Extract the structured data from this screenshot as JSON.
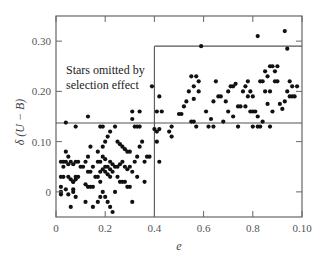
{
  "chart_data": {
    "type": "scatter",
    "title": "",
    "xlabel": "e",
    "ylabel": "δ (U − B)",
    "x_ticks": [
      {
        "value": 0.0,
        "label": "0"
      },
      {
        "value": 0.2,
        "label": "0.2"
      },
      {
        "value": 0.4,
        "label": "0.4"
      },
      {
        "value": 0.6,
        "label": "0.6"
      },
      {
        "value": 0.8,
        "label": "0.8"
      },
      {
        "value": 1.0,
        "label": "0.10"
      }
    ],
    "y_ticks": [
      {
        "value": 0.0,
        "label": "0"
      },
      {
        "value": 0.1,
        "label": "0.10"
      },
      {
        "value": 0.2,
        "label": "0.20"
      },
      {
        "value": 0.3,
        "label": "0.30"
      }
    ],
    "xlim": [
      0,
      1.0
    ],
    "ylim": [
      -0.05,
      0.35
    ],
    "grid": false,
    "annotations": [
      {
        "text_lines": [
          "Stars omitted by",
          "selection effect"
        ],
        "x": 0.06,
        "y": 0.25
      }
    ],
    "boundary_lines": [
      {
        "type": "horizontal",
        "y": 0.137,
        "x_from": 0.0,
        "x_to": 1.0
      },
      {
        "type": "vertical",
        "x": 0.4,
        "y_from": -0.05,
        "y_to": 0.29
      },
      {
        "type": "horizontal",
        "y": 0.29,
        "x_from": 0.4,
        "x_to": 1.0
      }
    ],
    "series": [
      {
        "name": "stars",
        "points": [
          [
            0.04,
            0.138
          ],
          [
            0.08,
            0.13
          ],
          [
            0.13,
            0.15
          ],
          [
            0.18,
            0.13
          ],
          [
            0.19,
            0.13
          ],
          [
            0.24,
            0.13
          ],
          [
            0.31,
            0.16
          ],
          [
            0.31,
            0.145
          ],
          [
            0.34,
            0.16
          ],
          [
            0.32,
            0.13
          ],
          [
            0.33,
            0.13
          ],
          [
            0.34,
            0.13
          ],
          [
            0.39,
            0.21
          ],
          [
            0.02,
            0.06
          ],
          [
            0.03,
            0.06
          ],
          [
            0.04,
            0.06
          ],
          [
            0.05,
            0.055
          ],
          [
            0.06,
            0.06
          ],
          [
            0.07,
            0.055
          ],
          [
            0.08,
            0.06
          ],
          [
            0.09,
            0.06
          ],
          [
            0.04,
            0.08
          ],
          [
            0.05,
            0.07
          ],
          [
            0.03,
            0.05
          ],
          [
            0.02,
            0.03
          ],
          [
            0.03,
            0.03
          ],
          [
            0.05,
            0.03
          ],
          [
            0.06,
            0.025
          ],
          [
            0.07,
            0.02
          ],
          [
            0.08,
            0.03
          ],
          [
            0.09,
            0.03
          ],
          [
            0.08,
            0.025
          ],
          [
            0.07,
            0.02
          ],
          [
            0.1,
            0.05
          ],
          [
            0.11,
            0.05
          ],
          [
            0.02,
            0.01
          ],
          [
            0.02,
            0.0
          ],
          [
            0.02,
            -0.005
          ],
          [
            0.04,
            0.005
          ],
          [
            0.05,
            -0.005
          ],
          [
            0.07,
            0.0
          ],
          [
            0.08,
            -0.01
          ],
          [
            0.07,
            0.005
          ],
          [
            0.06,
            -0.03
          ],
          [
            0.12,
            0.06
          ],
          [
            0.13,
            0.04
          ],
          [
            0.14,
            0.04
          ],
          [
            0.12,
            0.015
          ],
          [
            0.13,
            0.01
          ],
          [
            0.14,
            0.01
          ],
          [
            0.15,
            0.01
          ],
          [
            0.13,
            0.07
          ],
          [
            0.14,
            0.09
          ],
          [
            0.15,
            0.05
          ],
          [
            0.12,
            -0.02
          ],
          [
            0.15,
            -0.03
          ],
          [
            0.17,
            -0.02
          ],
          [
            0.16,
            0.03
          ],
          [
            0.17,
            0.03
          ],
          [
            0.18,
            0.04
          ],
          [
            0.19,
            0.045
          ],
          [
            0.2,
            0.05
          ],
          [
            0.21,
            0.05
          ],
          [
            0.22,
            0.045
          ],
          [
            0.2,
            0.04
          ],
          [
            0.21,
            0.035
          ],
          [
            0.22,
            0.03
          ],
          [
            0.23,
            0.04
          ],
          [
            0.24,
            0.05
          ],
          [
            0.25,
            0.05
          ],
          [
            0.26,
            0.055
          ],
          [
            0.18,
            0.06
          ],
          [
            0.19,
            0.07
          ],
          [
            0.19,
            0.09
          ],
          [
            0.2,
            0.1
          ],
          [
            0.21,
            0.11
          ],
          [
            0.22,
            0.12
          ],
          [
            0.2,
            0.065
          ],
          [
            0.22,
            0.06
          ],
          [
            0.23,
            0.055
          ],
          [
            0.17,
            0.08
          ],
          [
            0.17,
            0.06
          ],
          [
            0.18,
            0.02
          ],
          [
            0.19,
            0.0
          ],
          [
            0.2,
            -0.01
          ],
          [
            0.18,
            -0.01
          ],
          [
            0.21,
            -0.02
          ],
          [
            0.22,
            -0.03
          ],
          [
            0.23,
            -0.04
          ],
          [
            0.25,
            0.1
          ],
          [
            0.26,
            0.095
          ],
          [
            0.27,
            0.09
          ],
          [
            0.28,
            0.085
          ],
          [
            0.29,
            0.08
          ],
          [
            0.3,
            0.08
          ],
          [
            0.27,
            0.06
          ],
          [
            0.28,
            0.05
          ],
          [
            0.29,
            0.045
          ],
          [
            0.3,
            0.05
          ],
          [
            0.31,
            0.04
          ],
          [
            0.32,
            0.06
          ],
          [
            0.33,
            0.07
          ],
          [
            0.34,
            0.09
          ],
          [
            0.25,
            0.03
          ],
          [
            0.26,
            0.02
          ],
          [
            0.27,
            0.02
          ],
          [
            0.28,
            0.02
          ],
          [
            0.29,
            0.01
          ],
          [
            0.3,
            0.01
          ],
          [
            0.31,
            -0.02
          ],
          [
            0.24,
            0.0
          ],
          [
            0.33,
            0.03
          ],
          [
            0.35,
            0.1
          ],
          [
            0.36,
            0.06
          ],
          [
            0.37,
            0.07
          ],
          [
            0.36,
            0.02
          ],
          [
            0.38,
            0.07
          ],
          [
            0.4,
            0.125
          ],
          [
            0.41,
            0.1
          ],
          [
            0.42,
            0.06
          ],
          [
            0.41,
            0.12
          ],
          [
            0.42,
            0.125
          ],
          [
            0.41,
            0.16
          ],
          [
            0.42,
            0.19
          ],
          [
            0.43,
            0.16
          ],
          [
            0.46,
            0.12
          ],
          [
            0.47,
            0.11
          ],
          [
            0.47,
            0.13
          ],
          [
            0.5,
            0.155
          ],
          [
            0.51,
            0.155
          ],
          [
            0.52,
            0.17
          ],
          [
            0.53,
            0.18
          ],
          [
            0.54,
            0.2
          ],
          [
            0.55,
            0.14
          ],
          [
            0.56,
            0.14
          ],
          [
            0.57,
            0.13
          ],
          [
            0.55,
            0.23
          ],
          [
            0.56,
            0.21
          ],
          [
            0.56,
            0.185
          ],
          [
            0.57,
            0.23
          ],
          [
            0.58,
            0.2
          ],
          [
            0.58,
            0.22
          ],
          [
            0.59,
            0.29
          ],
          [
            0.61,
            0.16
          ],
          [
            0.62,
            0.13
          ],
          [
            0.63,
            0.145
          ],
          [
            0.64,
            0.18
          ],
          [
            0.65,
            0.22
          ],
          [
            0.66,
            0.19
          ],
          [
            0.67,
            0.19
          ],
          [
            0.68,
            0.14
          ],
          [
            0.69,
            0.18
          ],
          [
            0.7,
            0.2
          ],
          [
            0.71,
            0.21
          ],
          [
            0.72,
            0.21
          ],
          [
            0.73,
            0.215
          ],
          [
            0.74,
            0.17
          ],
          [
            0.75,
            0.17
          ],
          [
            0.76,
            0.2
          ],
          [
            0.77,
            0.21
          ],
          [
            0.78,
            0.22
          ],
          [
            0.78,
            0.19
          ],
          [
            0.79,
            0.2
          ],
          [
            0.8,
            0.19
          ],
          [
            0.79,
            0.16
          ],
          [
            0.8,
            0.16
          ],
          [
            0.81,
            0.16
          ],
          [
            0.82,
            0.15
          ],
          [
            0.8,
            0.13
          ],
          [
            0.82,
            0.13
          ],
          [
            0.83,
            0.13
          ],
          [
            0.84,
            0.14
          ],
          [
            0.85,
            0.2
          ],
          [
            0.86,
            0.175
          ],
          [
            0.87,
            0.2
          ],
          [
            0.88,
            0.16
          ],
          [
            0.83,
            0.22
          ],
          [
            0.84,
            0.22
          ],
          [
            0.85,
            0.24
          ],
          [
            0.86,
            0.23
          ],
          [
            0.87,
            0.25
          ],
          [
            0.88,
            0.25
          ],
          [
            0.89,
            0.24
          ],
          [
            0.9,
            0.25
          ],
          [
            0.89,
            0.22
          ],
          [
            0.9,
            0.22
          ],
          [
            0.91,
            0.175
          ],
          [
            0.92,
            0.165
          ],
          [
            0.93,
            0.18
          ],
          [
            0.94,
            0.2
          ],
          [
            0.95,
            0.19
          ],
          [
            0.96,
            0.21
          ],
          [
            0.97,
            0.19
          ],
          [
            0.98,
            0.21
          ],
          [
            0.95,
            0.22
          ],
          [
            0.96,
            0.19
          ],
          [
            0.7,
            0.16
          ],
          [
            0.72,
            0.15
          ],
          [
            0.74,
            0.13
          ],
          [
            0.77,
            0.17
          ],
          [
            0.82,
            0.31
          ],
          [
            0.93,
            0.32
          ],
          [
            0.94,
            0.285
          ],
          [
            0.64,
            0.13
          ],
          [
            0.87,
            0.13
          ]
        ]
      }
    ]
  },
  "labels": {
    "ylabel": "δ (U − B)",
    "xlabel": "e",
    "annotation_line1": "Stars omitted by",
    "annotation_line2": "selection effect"
  }
}
